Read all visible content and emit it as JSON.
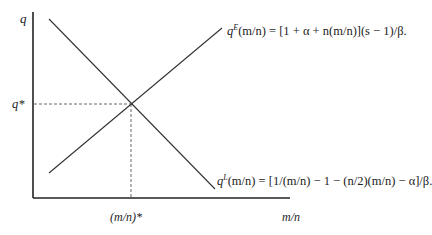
{
  "diagram": {
    "axes": {
      "y_label": "q",
      "x_label": "m/n",
      "origin": [
        33,
        198
      ],
      "y_top": 12,
      "x_right": 290
    },
    "equilibrium": {
      "y_label": "q*",
      "x_label": "(m/n)*",
      "point": [
        131,
        104
      ]
    },
    "curves": [
      {
        "name": "qE",
        "symbol": "q",
        "superscript": "E",
        "equation_rest": "(m/n) = [1 + α + n(m/n)](s − 1)/β.",
        "start": [
          49,
          173
        ],
        "end": [
          222,
          28
        ],
        "slope": "upward"
      },
      {
        "name": "qL",
        "symbol": "q",
        "superscript": "L",
        "equation_rest": "(m/n) = [1/(m/n) − 1 − (n/2)(m/n) − α]/β.",
        "start": [
          49,
          19
        ],
        "end": [
          215,
          189
        ],
        "slope": "downward"
      }
    ],
    "colors": {
      "line": "#333333",
      "axis": "#222222",
      "dashed": "#555555"
    }
  }
}
